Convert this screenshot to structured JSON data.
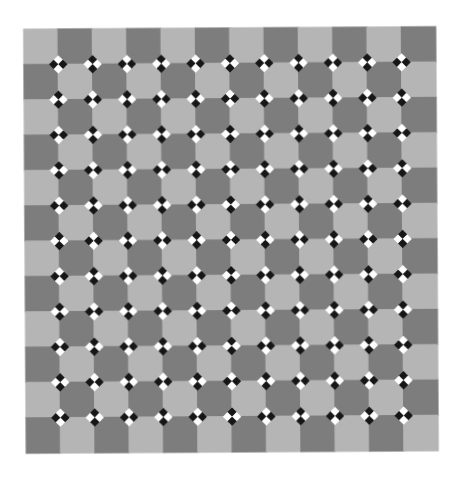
{
  "figure": {
    "title": "Dotted checkerboard scintillation illusion",
    "background_color": "#ffffff",
    "canvas": {
      "width": 461,
      "height": 481
    }
  },
  "grid": {
    "name": "checkerboard-grid",
    "origin_x": 25,
    "origin_y": 28,
    "width": 412,
    "height": 424,
    "columns": 12,
    "rows": 12,
    "cell_width": 34.33,
    "cell_height": 35.33,
    "light_color": "#b5b5b5",
    "dark_color": "#7d7d7d",
    "first_cell_tone": "light",
    "edge_softness": 1.1,
    "rotation_deg": -0.35
  },
  "dot_clusters": {
    "name": "dot-cluster-layer",
    "description": "Two-by-two checkered squares rotated 45 degrees, centered on each interior lattice intersection.",
    "columns": 11,
    "rows": 11,
    "cell_size": 6.5,
    "cluster_size": 13,
    "rotation_deg": 45,
    "light_dot_color": "#ffffff",
    "dark_dot_color": "#141414",
    "parity_rule": "alternating-checker"
  },
  "chart_data": {
    "type": "heatmap",
    "title": "Dotted checkerboard scintillation illusion",
    "xlabel": "",
    "ylabel": "",
    "categories": [
      "c1",
      "c2",
      "c3",
      "c4",
      "c5",
      "c6",
      "c7",
      "c8",
      "c9",
      "c10",
      "c11",
      "c12"
    ],
    "rows": [
      "r1",
      "r2",
      "r3",
      "r4",
      "r5",
      "r6",
      "r7",
      "r8",
      "r9",
      "r10",
      "r11",
      "r12"
    ],
    "legend": [
      {
        "label": "light square",
        "color": "#b5b5b5"
      },
      {
        "label": "dark square",
        "color": "#7d7d7d"
      },
      {
        "label": "white dot",
        "color": "#ffffff"
      },
      {
        "label": "black dot",
        "color": "#141414"
      }
    ],
    "values": [
      [
        0,
        1,
        0,
        1,
        0,
        1,
        0,
        1,
        0,
        1,
        0,
        1
      ],
      [
        1,
        0,
        1,
        0,
        1,
        0,
        1,
        0,
        1,
        0,
        1,
        0
      ],
      [
        0,
        1,
        0,
        1,
        0,
        1,
        0,
        1,
        0,
        1,
        0,
        1
      ],
      [
        1,
        0,
        1,
        0,
        1,
        0,
        1,
        0,
        1,
        0,
        1,
        0
      ],
      [
        0,
        1,
        0,
        1,
        0,
        1,
        0,
        1,
        0,
        1,
        0,
        1
      ],
      [
        1,
        0,
        1,
        0,
        1,
        0,
        1,
        0,
        1,
        0,
        1,
        0
      ],
      [
        0,
        1,
        0,
        1,
        0,
        1,
        0,
        1,
        0,
        1,
        0,
        1
      ],
      [
        1,
        0,
        1,
        0,
        1,
        0,
        1,
        0,
        1,
        0,
        1,
        0
      ],
      [
        0,
        1,
        0,
        1,
        0,
        1,
        0,
        1,
        0,
        1,
        0,
        1
      ],
      [
        1,
        0,
        1,
        0,
        1,
        0,
        1,
        0,
        1,
        0,
        1,
        0
      ],
      [
        0,
        1,
        0,
        1,
        0,
        1,
        0,
        1,
        0,
        1,
        0,
        1
      ],
      [
        1,
        0,
        1,
        0,
        1,
        0,
        1,
        0,
        1,
        0,
        1,
        0
      ]
    ]
  }
}
